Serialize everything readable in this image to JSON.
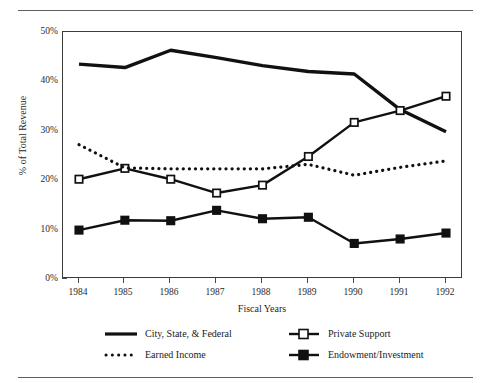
{
  "chart_data": {
    "type": "line",
    "title": "",
    "subtitle": "",
    "xlabel": "Fiscal Years",
    "ylabel": "% of Total Revenue",
    "categories": [
      "1984",
      "1985",
      "1986",
      "1987",
      "1988",
      "1989",
      "1990",
      "1991",
      "1992"
    ],
    "x": [
      1984,
      1985,
      1986,
      1987,
      1988,
      1989,
      1990,
      1991,
      1992
    ],
    "ylim": [
      0,
      50
    ],
    "yticks": [
      0,
      10,
      20,
      30,
      40,
      50
    ],
    "ytick_labels": [
      "0%",
      "10%",
      "20%",
      "30%",
      "40%",
      "50%"
    ],
    "grid": false,
    "legend_position": "bottom",
    "series": [
      {
        "name": "City, State, & Federal",
        "style": "thick-solid",
        "marker": "none",
        "color": "#111111",
        "values": [
          43.5,
          42.8,
          46.3,
          44.8,
          43.2,
          42.0,
          41.5,
          34.3,
          29.8
        ]
      },
      {
        "name": "Private Support",
        "style": "solid",
        "marker": "open-square",
        "color": "#111111",
        "values": [
          20.2,
          22.4,
          20.2,
          17.4,
          19.0,
          24.8,
          31.7,
          34.1,
          37.0
        ]
      },
      {
        "name": "Earned Income",
        "style": "dotted",
        "marker": "none",
        "color": "#111111",
        "values": [
          27.2,
          22.5,
          22.3,
          22.3,
          22.3,
          23.2,
          21.0,
          22.6,
          23.9
        ]
      },
      {
        "name": "Endowment/Investment",
        "style": "solid",
        "marker": "filled-square",
        "color": "#111111",
        "values": [
          9.9,
          11.9,
          11.8,
          13.9,
          12.2,
          12.5,
          7.2,
          8.1,
          9.3
        ]
      }
    ]
  },
  "axes": {
    "y_title": "% of Total Revenue",
    "x_title": "Fiscal Years",
    "y_labels": [
      "50%",
      "40%",
      "30%",
      "20%",
      "10%",
      "0%"
    ],
    "x_labels": [
      "1984",
      "1985",
      "1986",
      "1987",
      "1988",
      "1989",
      "1990",
      "1991",
      "1992"
    ]
  },
  "legend": {
    "items": [
      {
        "label": "City, State, & Federal",
        "symbol": "thick-line"
      },
      {
        "label": "Private Support",
        "symbol": "line-open-square"
      },
      {
        "label": "Earned Income",
        "symbol": "dotted-line"
      },
      {
        "label": "Endowment/Investment",
        "symbol": "line-filled-square"
      }
    ]
  }
}
